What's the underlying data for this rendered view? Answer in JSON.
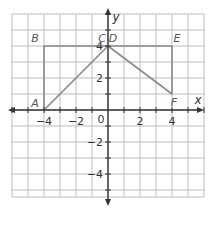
{
  "diagram": {
    "type": "coordinate-plane",
    "axes": {
      "x_label": "x",
      "y_label": "y",
      "origin_label": "0",
      "x_range": [
        -6,
        6
      ],
      "y_range": [
        -5.5,
        6
      ],
      "grid_step": 1,
      "x_tick_labels": [
        "-4",
        "-2",
        "2",
        "4"
      ],
      "y_tick_labels": [
        "4",
        "2",
        "-2",
        "-4"
      ],
      "x_tick_values": [
        -4,
        -2,
        2,
        4
      ],
      "y_tick_values": [
        4,
        2,
        -2,
        -4
      ]
    },
    "points": [
      {
        "label": "A",
        "x": -4,
        "y": 0
      },
      {
        "label": "B",
        "x": -4,
        "y": 4
      },
      {
        "label": "C",
        "x": 0,
        "y": 4
      },
      {
        "label": "D",
        "x": 0,
        "y": 4
      },
      {
        "label": "E",
        "x": 4,
        "y": 4
      },
      {
        "label": "F",
        "x": 4,
        "y": 1
      }
    ],
    "figures": [
      {
        "name": "triangle-ABC",
        "vertices": [
          "A",
          "B",
          "C"
        ]
      },
      {
        "name": "triangle-DEF",
        "vertices": [
          "D",
          "E",
          "F"
        ]
      }
    ],
    "colors": {
      "grid": "#bdbdbd",
      "axis": "#333333",
      "figure": "#8a8a8a",
      "background": "#ffffff"
    }
  }
}
